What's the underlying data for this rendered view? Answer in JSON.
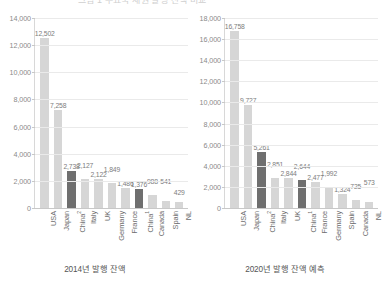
{
  "top_strip": {
    "text": "그림 1  주요국 채권 발행 잔액 비교"
  },
  "chart_data": [
    {
      "type": "bar",
      "id": "left",
      "title": "2014년 발행 잔액",
      "caption": "2014년 발행 잔액",
      "xlabel": "",
      "ylabel": "",
      "ylim": [
        0,
        14000
      ],
      "yticks": [
        0,
        2000,
        4000,
        6000,
        8000,
        10000,
        12000,
        14000
      ],
      "ytick_labels": [
        "0",
        "2,000",
        "4,000",
        "6,000",
        "8,000",
        "10,000",
        "12,000",
        "14,000"
      ],
      "grid": true,
      "legend": "none",
      "categories": [
        "USA",
        "Japan",
        "China²",
        "Italy",
        "UK",
        "Germany",
        "France",
        "China¹",
        "Canada",
        "Spain",
        "NL"
      ],
      "category_labels": [
        {
          "name": "USA",
          "sup": ""
        },
        {
          "name": "Japan",
          "sup": ""
        },
        {
          "name": "China",
          "sup": "2"
        },
        {
          "name": "Italy",
          "sup": ""
        },
        {
          "name": "UK",
          "sup": ""
        },
        {
          "name": "Germany",
          "sup": ""
        },
        {
          "name": "France",
          "sup": ""
        },
        {
          "name": "China",
          "sup": "1"
        },
        {
          "name": "Canada",
          "sup": ""
        },
        {
          "name": "Spain",
          "sup": ""
        },
        {
          "name": "NL",
          "sup": ""
        }
      ],
      "values": [
        12502,
        7258,
        2738,
        2127,
        2122,
        1849,
        1486,
        1376,
        988,
        541,
        429
      ],
      "value_labels": [
        "12,502",
        "7,258",
        "2,738",
        "2,127",
        "2,122",
        "1,849",
        "1,486",
        "1,376",
        "988",
        "541",
        "429"
      ],
      "highlight_indices": [
        2,
        7
      ],
      "label_offsets": [
        0,
        0,
        0,
        9,
        0,
        9,
        0,
        0,
        9,
        15,
        5
      ],
      "colors": {
        "bar": "#d6d6d6",
        "bar_highlight": "#6f6f6f",
        "text": "#7d7d7d",
        "axis": "#c8c8c8",
        "grid": "#eaeaea"
      }
    },
    {
      "type": "bar",
      "id": "right",
      "title": "2020년 발행 잔액 예측",
      "caption": "2020년 발행 잔액 예측",
      "xlabel": "",
      "ylabel": "",
      "ylim": [
        0,
        18000
      ],
      "yticks": [
        0,
        2000,
        4000,
        6000,
        8000,
        10000,
        12000,
        14000,
        16000,
        18000
      ],
      "ytick_labels": [
        "0",
        "2,000",
        "4,000",
        "6,000",
        "8,000",
        "10,000",
        "12,000",
        "14,000",
        "16,000",
        "18,000"
      ],
      "grid": true,
      "legend": "none",
      "categories": [
        "USA",
        "Japan",
        "China²",
        "Italy",
        "UK",
        "China¹",
        "France",
        "Germany",
        "Spain",
        "Canada",
        "NL"
      ],
      "category_labels": [
        {
          "name": "USA",
          "sup": ""
        },
        {
          "name": "Japan",
          "sup": ""
        },
        {
          "name": "China",
          "sup": "2"
        },
        {
          "name": "Italy",
          "sup": ""
        },
        {
          "name": "UK",
          "sup": ""
        },
        {
          "name": "China",
          "sup": "1"
        },
        {
          "name": "France",
          "sup": ""
        },
        {
          "name": "Germany",
          "sup": ""
        },
        {
          "name": "Spain",
          "sup": ""
        },
        {
          "name": "Canada",
          "sup": ""
        },
        {
          "name": "NL",
          "sup": ""
        }
      ],
      "values": [
        16758,
        9727,
        5261,
        2851,
        2844,
        2644,
        2477,
        1992,
        1324,
        725,
        573
      ],
      "value_labels": [
        "16,758",
        "9,727",
        "5,261",
        "2,851",
        "2,844",
        "2,644",
        "2,477",
        "1,992",
        "1,324",
        "725",
        "573"
      ],
      "highlight_indices": [
        2,
        5
      ],
      "label_offsets": [
        0,
        0,
        0,
        9,
        0,
        9,
        0,
        9,
        0,
        9,
        15
      ],
      "colors": {
        "bar": "#d6d6d6",
        "bar_highlight": "#6f6f6f",
        "text": "#7d7d7d",
        "axis": "#c8c8c8",
        "grid": "#eaeaea"
      }
    }
  ]
}
